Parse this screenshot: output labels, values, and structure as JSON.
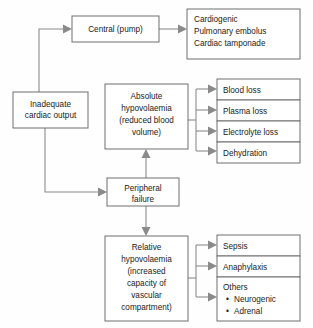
{
  "diagram": {
    "type": "flowchart",
    "orientation": "left-to-right",
    "line_color": "#8a8a8a",
    "box_border_color": "#6e6e6e",
    "background_color": "#fefefe",
    "text_color": "#1a1a1a"
  },
  "nodes": {
    "inadequate": {
      "id": "inadequate-cardiac-output",
      "lines": [
        "Inadequate",
        "cardiac output"
      ],
      "line1": "Inadequate",
      "line2": "cardiac output",
      "align": "center"
    },
    "central": {
      "id": "central-pump",
      "lines": [
        "Central (pump)"
      ],
      "line1": "Central (pump)",
      "align": "center"
    },
    "cardiac_causes": {
      "id": "cardiac-causes",
      "lines": [
        "Cardiogenic",
        "Pulmonary embolus",
        "Cardiac tamponade"
      ],
      "line1": "Cardiogenic",
      "line2": "Pulmonary embolus",
      "line3": "Cardiac tamponade",
      "align": "left"
    },
    "absolute": {
      "id": "absolute-hypovolaemia",
      "lines": [
        "Absolute",
        "hypovolaemia",
        "(reduced blood",
        "volume)"
      ],
      "line1": "Absolute",
      "line2": "hypovolaemia",
      "line3": "(reduced blood",
      "line4": "volume)",
      "align": "center"
    },
    "peripheral": {
      "id": "peripheral-failure",
      "lines": [
        "Peripheral",
        "failure"
      ],
      "line1": "Peripheral",
      "line2": "failure",
      "align": "center"
    },
    "relative": {
      "id": "relative-hypovolaemia",
      "lines": [
        "Relative",
        "hypovolaemia",
        "(increased",
        "capacity of",
        "vascular",
        "compartment)"
      ],
      "line1": "Relative",
      "line2": "hypovolaemia",
      "line3": "(increased",
      "line4": "capacity of",
      "line5": "vascular",
      "line6": "compartment)",
      "align": "center"
    },
    "blood_loss": {
      "id": "blood-loss",
      "label": "Blood loss"
    },
    "plasma_loss": {
      "id": "plasma-loss",
      "label": "Plasma loss"
    },
    "electrolyte_loss": {
      "id": "electrolyte-loss",
      "label": "Electrolyte loss"
    },
    "dehydration": {
      "id": "dehydration",
      "label": "Dehydration"
    },
    "sepsis": {
      "id": "sepsis",
      "label": "Sepsis"
    },
    "anaphylaxis": {
      "id": "anaphylaxis",
      "label": "Anaphylaxis"
    },
    "others": {
      "id": "others",
      "label": "Others",
      "bullets": [
        "Neurogenic",
        "Adrenal"
      ],
      "bullet1": "Neurogenic",
      "bullet2": "Adrenal",
      "bullet_glyph": "•"
    }
  },
  "edges": [
    {
      "from": "inadequate-cardiac-output",
      "to": "central-pump",
      "style": "elbow-up",
      "arrow": true
    },
    {
      "from": "inadequate-cardiac-output",
      "to": "peripheral-failure",
      "style": "elbow-down",
      "arrow": true
    },
    {
      "from": "central-pump",
      "to": "cardiac-causes",
      "style": "straight-right",
      "arrow": true
    },
    {
      "from": "peripheral-failure",
      "to": "absolute-hypovolaemia",
      "style": "straight-up",
      "arrow": true
    },
    {
      "from": "peripheral-failure",
      "to": "relative-hypovolaemia",
      "style": "straight-down",
      "arrow": true
    },
    {
      "from": "absolute-hypovolaemia",
      "to": "blood-loss",
      "style": "branch-right",
      "arrow": true
    },
    {
      "from": "absolute-hypovolaemia",
      "to": "plasma-loss",
      "style": "branch-right",
      "arrow": true
    },
    {
      "from": "absolute-hypovolaemia",
      "to": "electrolyte-loss",
      "style": "branch-right",
      "arrow": true
    },
    {
      "from": "absolute-hypovolaemia",
      "to": "dehydration",
      "style": "branch-right",
      "arrow": true
    },
    {
      "from": "relative-hypovolaemia",
      "to": "sepsis",
      "style": "branch-right",
      "arrow": true
    },
    {
      "from": "relative-hypovolaemia",
      "to": "anaphylaxis",
      "style": "branch-right",
      "arrow": true
    },
    {
      "from": "relative-hypovolaemia",
      "to": "others",
      "style": "branch-right",
      "arrow": true
    }
  ]
}
